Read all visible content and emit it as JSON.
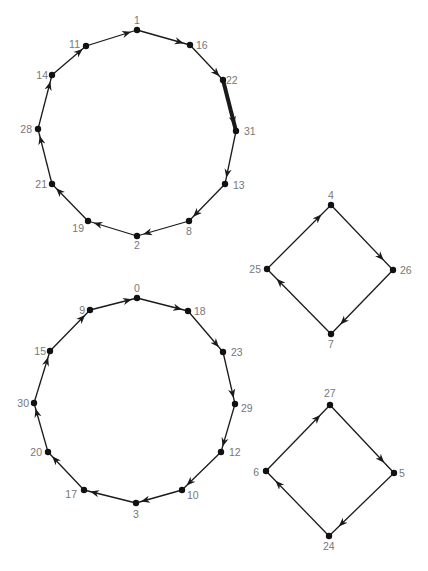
{
  "figure": {
    "type": "directed-cycle-graph",
    "arrow_color": "#1a1a1a",
    "node_color": "#111111",
    "label_color": "#777777",
    "caption": "",
    "cycles": [
      {
        "name": "cycle-12-top",
        "nodes": [
          {
            "id": "1",
            "x": 137,
            "y": 30,
            "lx": 134,
            "ly": 24,
            "anchor": "start"
          },
          {
            "id": "16",
            "x": 190,
            "y": 45,
            "lx": 196,
            "ly": 49,
            "anchor": "start"
          },
          {
            "id": "22",
            "x": 223,
            "y": 80,
            "lx": 226,
            "ly": 84,
            "anchor": "start"
          },
          {
            "id": "31",
            "x": 236,
            "y": 131,
            "lx": 244,
            "ly": 135,
            "anchor": "start"
          },
          {
            "id": "13",
            "x": 225,
            "y": 184,
            "lx": 233,
            "ly": 189,
            "anchor": "start"
          },
          {
            "id": "8",
            "x": 189,
            "y": 221,
            "lx": 186,
            "ly": 235,
            "anchor": "start"
          },
          {
            "id": "2",
            "x": 137,
            "y": 236,
            "lx": 134,
            "ly": 249,
            "anchor": "start"
          },
          {
            "id": "19",
            "x": 88,
            "y": 221,
            "lx": 84,
            "ly": 232,
            "anchor": "end"
          },
          {
            "id": "21",
            "x": 52,
            "y": 184,
            "lx": 47,
            "ly": 188,
            "anchor": "end"
          },
          {
            "id": "28",
            "x": 38,
            "y": 129,
            "lx": 32,
            "ly": 133,
            "anchor": "end"
          },
          {
            "id": "14",
            "x": 52,
            "y": 75,
            "lx": 48,
            "ly": 79,
            "anchor": "end"
          },
          {
            "id": "11",
            "x": 86,
            "y": 46,
            "lx": 80,
            "ly": 48,
            "anchor": "end"
          }
        ],
        "thick_edges": [
          "22-31"
        ]
      },
      {
        "name": "cycle-12-bottom",
        "nodes": [
          {
            "id": "0",
            "x": 137,
            "y": 298,
            "lx": 134,
            "ly": 292,
            "anchor": "start"
          },
          {
            "id": "18",
            "x": 188,
            "y": 311,
            "lx": 194,
            "ly": 315,
            "anchor": "start"
          },
          {
            "id": "23",
            "x": 223,
            "y": 352,
            "lx": 231,
            "ly": 356,
            "anchor": "start"
          },
          {
            "id": "29",
            "x": 235,
            "y": 404,
            "lx": 241,
            "ly": 412,
            "anchor": "start"
          },
          {
            "id": "12",
            "x": 221,
            "y": 452,
            "lx": 229,
            "ly": 456,
            "anchor": "start"
          },
          {
            "id": "10",
            "x": 182,
            "y": 490,
            "lx": 187,
            "ly": 499,
            "anchor": "start"
          },
          {
            "id": "3",
            "x": 136,
            "y": 503,
            "lx": 133,
            "ly": 518,
            "anchor": "start"
          },
          {
            "id": "17",
            "x": 84,
            "y": 490,
            "lx": 77,
            "ly": 498,
            "anchor": "end"
          },
          {
            "id": "20",
            "x": 48,
            "y": 452,
            "lx": 42,
            "ly": 456,
            "anchor": "end"
          },
          {
            "id": "30",
            "x": 34,
            "y": 403,
            "lx": 29,
            "ly": 407,
            "anchor": "end"
          },
          {
            "id": "15",
            "x": 50,
            "y": 351,
            "lx": 46,
            "ly": 355,
            "anchor": "end"
          },
          {
            "id": "9",
            "x": 90,
            "y": 310,
            "lx": 85,
            "ly": 314,
            "anchor": "end"
          }
        ],
        "thick_edges": []
      },
      {
        "name": "cycle-4-upper-right",
        "nodes": [
          {
            "id": "4",
            "x": 331,
            "y": 205,
            "lx": 328,
            "ly": 199,
            "anchor": "start"
          },
          {
            "id": "26",
            "x": 393,
            "y": 270,
            "lx": 400,
            "ly": 274,
            "anchor": "start"
          },
          {
            "id": "7",
            "x": 331,
            "y": 334,
            "lx": 328,
            "ly": 348,
            "anchor": "start"
          },
          {
            "id": "25",
            "x": 267,
            "y": 269,
            "lx": 261,
            "ly": 273,
            "anchor": "end"
          }
        ],
        "thick_edges": []
      },
      {
        "name": "cycle-4-lower-right",
        "nodes": [
          {
            "id": "27",
            "x": 330,
            "y": 405,
            "lx": 324,
            "ly": 397,
            "anchor": "start"
          },
          {
            "id": "5",
            "x": 394,
            "y": 473,
            "lx": 399,
            "ly": 477,
            "anchor": "start"
          },
          {
            "id": "24",
            "x": 329,
            "y": 536,
            "lx": 323,
            "ly": 550,
            "anchor": "start"
          },
          {
            "id": "6",
            "x": 266,
            "y": 471,
            "lx": 259,
            "ly": 476,
            "anchor": "end"
          }
        ],
        "thick_edges": []
      }
    ]
  }
}
